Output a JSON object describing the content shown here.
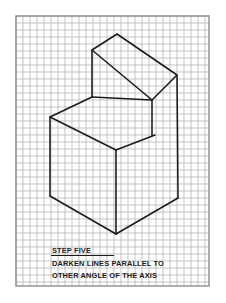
{
  "page": {
    "background_color": "#ffffff",
    "width": 226,
    "height": 303
  },
  "sheet": {
    "name": "isometric-grid-sheet",
    "grid_color": "#b9b9b9",
    "border_color": "#8d8d8d",
    "line_color": "#1b1b1b",
    "grid": {
      "left": 16,
      "top": 16,
      "right": 209,
      "bottom": 286,
      "cell_size": 7.0,
      "columns": 27,
      "rows": 38
    }
  },
  "caption": {
    "title": "STEP FIVE",
    "line1": "DARKEN LINES PARALLEL TO",
    "line2": "OTHER ANGLE OF THE AXIS",
    "title_underlined": true
  },
  "drawing": {
    "name": "isometric-step-block",
    "description": "Isometric pictorial of a two-level step block drawn on square grid paper",
    "vertices": {
      "top_apex": [
        117,
        34
      ],
      "top_left": [
        92,
        50
      ],
      "top_right": [
        177,
        75
      ],
      "top_front": [
        152,
        100
      ],
      "step_inner_corner": [
        155,
        135
      ],
      "mid_left_back": [
        92,
        97
      ],
      "mid_left": [
        50,
        117
      ],
      "mid_front": [
        116,
        150
      ],
      "left_bottom": [
        50,
        196
      ],
      "bottom_apex": [
        116,
        234
      ],
      "right_bottom": [
        178,
        198
      ]
    },
    "paths": [
      "M117,34 L92,50 L152,100 L177,75 Z",
      "M92,50 L92,97",
      "M92,97 L152,100",
      "M152,100 L152,135",
      "M177,75 L178,198",
      "M92,97 L50,117",
      "M50,117 L116,150",
      "M116,150 L155,135",
      "M50,117 L50,196",
      "M50,196 L116,234",
      "M116,234 L178,198",
      "M116,150 L116,234"
    ]
  }
}
